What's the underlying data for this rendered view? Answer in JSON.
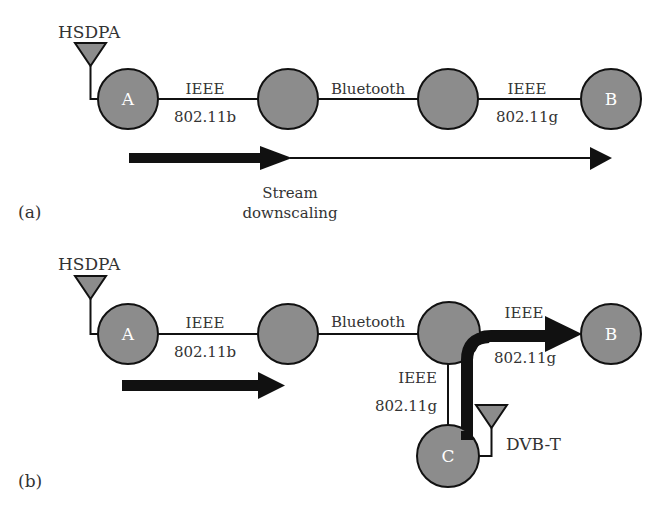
{
  "panels": {
    "a": {
      "label": "(a)",
      "antenna": "HSDPA",
      "nodes": [
        "A",
        "",
        "",
        "B"
      ],
      "links": [
        {
          "top": "IEEE",
          "bottom": "802.11b"
        },
        {
          "top": "Bluetooth",
          "bottom": ""
        },
        {
          "top": "IEEE",
          "bottom": "802.11g"
        }
      ],
      "annotation": {
        "line1": "Stream",
        "line2": "downscaling"
      }
    },
    "b": {
      "label": "(b)",
      "antenna": "HSDPA",
      "nodes": [
        "A",
        "",
        "",
        "B",
        "C"
      ],
      "links": [
        {
          "top": "IEEE",
          "bottom": "802.11b"
        },
        {
          "top": "Bluetooth",
          "bottom": ""
        },
        {
          "top": "IEEE",
          "bottom": "802.11g"
        },
        {
          "top": "IEEE",
          "bottom": "802.11g"
        }
      ],
      "antenna_c": "DVB-T"
    }
  },
  "colors": {
    "node_fill": "#8c8c8c",
    "stroke": "#111111",
    "text": "#333333"
  }
}
